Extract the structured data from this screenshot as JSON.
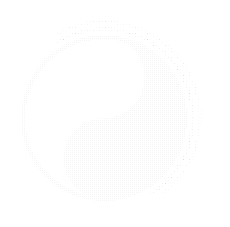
{
  "image": {
    "title": "Yin Yang Symbol",
    "alt_name": "taijitu",
    "width": 230,
    "height": 227,
    "background_color": "#ffffff",
    "style": "halftone dithered, very light gray line art"
  },
  "colors": {
    "background": "#ffffff",
    "yin_fill": "#e9e9e9",
    "yang_fill": "#ffffff",
    "outline": "#e0e0e0",
    "outer_arc": "#f0f0f0",
    "dot_light": "#ffffff",
    "dot_dark": "#e4e4e4"
  },
  "geometry": {
    "center_x": 104,
    "center_y": 118,
    "radius": 81,
    "half_radius": 40.5,
    "upper_dot": {
      "cx": 104,
      "cy": 88,
      "r": 5,
      "fill": "#ffffff"
    },
    "lower_dot": {
      "cx": 106,
      "cy": 155,
      "r": 4,
      "fill": "#e4e4e4"
    },
    "outer_arc_1_radius": 89,
    "outer_arc_2_radius": 96
  },
  "elements": [
    {
      "name": "main-circle",
      "label": "Outer boundary circle"
    },
    {
      "name": "yin-half",
      "label": "Dark (yin) half"
    },
    {
      "name": "yang-half",
      "label": "Light (yang) half"
    },
    {
      "name": "upper-dot",
      "label": "Light dot in dark half"
    },
    {
      "name": "lower-dot",
      "label": "Dark dot in light half"
    },
    {
      "name": "outer-arc-inner",
      "label": "Inner decorative sweep arc"
    },
    {
      "name": "outer-arc-outer",
      "label": "Outer decorative sweep arc"
    }
  ]
}
